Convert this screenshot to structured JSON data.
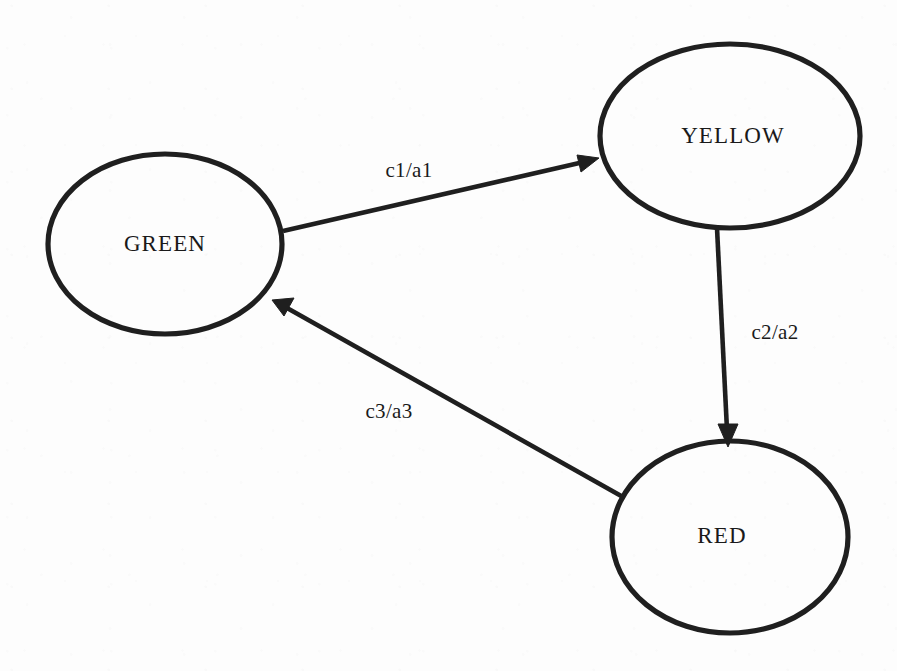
{
  "diagram": {
    "type": "state-transition-diagram",
    "background_color": "#fdfdfd",
    "stroke_color": "#1f1f1f",
    "text_color": "#1a1a1a",
    "states": [
      {
        "id": "green",
        "label": "GREEN",
        "cx": 165,
        "cy": 244,
        "rx": 117,
        "ry": 90
      },
      {
        "id": "yellow",
        "label": "YELLOW",
        "cx": 730,
        "cy": 136,
        "rx": 130,
        "ry": 92
      },
      {
        "id": "red",
        "label": "RED",
        "cx": 730,
        "cy": 537,
        "rx": 118,
        "ry": 96
      }
    ],
    "transitions": [
      {
        "id": "t1",
        "from": "green",
        "to": "yellow",
        "label": "c1/a1",
        "label_x": 409,
        "label_y": 172,
        "x1": 283,
        "y1": 231,
        "x2": 597,
        "y2": 159
      },
      {
        "id": "t2",
        "from": "yellow",
        "to": "red",
        "label": "c2/a2",
        "label_x": 775,
        "label_y": 334,
        "x1": 717,
        "y1": 228,
        "x2": 728,
        "y2": 441
      },
      {
        "id": "t3",
        "from": "red",
        "to": "green",
        "label": "c3/a3",
        "label_x": 389,
        "label_y": 413,
        "x1": 623,
        "y1": 497,
        "x2": 276,
        "y2": 302
      }
    ]
  }
}
